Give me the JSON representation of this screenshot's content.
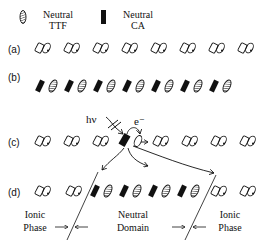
{
  "legend": {
    "ttf": {
      "label_line1": "Neutral",
      "label_line2": "TTF",
      "symbol": "hatched-ellipse"
    },
    "ca": {
      "label_line1": "Neutral",
      "label_line2": "CA",
      "symbol": "solid-rectangle"
    }
  },
  "rows": {
    "a": {
      "label": "(a)",
      "description": "Ionic dimer pairs (open shapes)",
      "count": 8
    },
    "b": {
      "label": "(b)",
      "description": "Neutral alternating CA/TTF chain",
      "count": 14
    },
    "c": {
      "label": "(c)",
      "description": "Photoexcitation creates charge-transfer",
      "count": 8
    },
    "d": {
      "label": "(d)",
      "description": "Neutral domain within ionic phase"
    }
  },
  "annotations": {
    "photon": "hν",
    "electron": "e⁻"
  },
  "phases": {
    "left": {
      "line1": "Ionic",
      "line2": "Phase"
    },
    "middle": {
      "line1": "Neutral",
      "line2": "Domain"
    },
    "right": {
      "line1": "Ionic",
      "line2": "Phase"
    }
  },
  "colors": {
    "ink": "#111111",
    "background": "#ffffff"
  }
}
